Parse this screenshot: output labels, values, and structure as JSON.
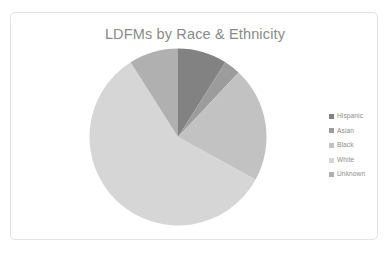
{
  "card": {
    "border_color": "#e3e3e3",
    "background": "#ffffff"
  },
  "chart_data": {
    "type": "pie",
    "title": "LDFMs by Race & Ethnicity",
    "xlabel": "",
    "ylabel": "",
    "legend_position": "right",
    "grid": false,
    "start_angle_deg": 0,
    "direction": "clockwise",
    "categories": [
      "Hispanic",
      "Asian",
      "Black",
      "White",
      "Unknown"
    ],
    "values": [
      9,
      3,
      21,
      58,
      9
    ],
    "units": "percent",
    "colors": [
      "#828282",
      "#9c9c9c",
      "#c2c2c2",
      "#d6d6d6",
      "#b0b0b0"
    ],
    "slices": [
      {
        "label": "Hispanic",
        "value": 9,
        "color": "#828282",
        "start_deg": 0,
        "end_deg": 32.4
      },
      {
        "label": "Asian",
        "value": 3,
        "color": "#9c9c9c",
        "start_deg": 32.4,
        "end_deg": 43.2
      },
      {
        "label": "Black",
        "value": 21,
        "color": "#c2c2c2",
        "start_deg": 43.2,
        "end_deg": 118.8
      },
      {
        "label": "White",
        "value": 58,
        "color": "#d6d6d6",
        "start_deg": 118.8,
        "end_deg": 327.6
      },
      {
        "label": "Unknown",
        "value": 9,
        "color": "#b0b0b0",
        "start_deg": 327.6,
        "end_deg": 360
      }
    ]
  },
  "title": {
    "text": "LDFMs by Race & Ethnicity",
    "color": "#8a8a8a"
  },
  "legend": {
    "items": [
      {
        "label": "Hispanic",
        "color": "#828282"
      },
      {
        "label": "Asian",
        "color": "#9c9c9c"
      },
      {
        "label": "Black",
        "color": "#c2c2c2"
      },
      {
        "label": "White",
        "color": "#d6d6d6"
      },
      {
        "label": "Unknown",
        "color": "#b0b0b0"
      }
    ]
  }
}
